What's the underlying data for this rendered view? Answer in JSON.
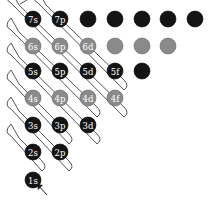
{
  "diagram": {
    "title": "",
    "type": "aufbau-principle-orbital-filling-order",
    "colors": {
      "dark": "#141414",
      "gray": "#8a8a8a",
      "label_text": "#ffffff",
      "line": "#555555",
      "background": "#ffffff"
    },
    "columns": {
      "s": 33,
      "p": 60,
      "d": 88,
      "f": 115,
      "g": 142,
      "h": 168,
      "i": 195
    },
    "rows": {
      "7": 19,
      "6": 46,
      "5": 71,
      "4": 98,
      "3": 125,
      "2": 152,
      "1": 180
    },
    "orbitals": [
      {
        "label": "7s",
        "row": "7",
        "col": "s",
        "tone": "dark"
      },
      {
        "label": "7p",
        "row": "7",
        "col": "p",
        "tone": "dark"
      },
      {
        "label": "",
        "row": "7",
        "col": "d",
        "tone": "dark"
      },
      {
        "label": "",
        "row": "7",
        "col": "f",
        "tone": "dark"
      },
      {
        "label": "",
        "row": "7",
        "col": "g",
        "tone": "dark"
      },
      {
        "label": "",
        "row": "7",
        "col": "h",
        "tone": "dark"
      },
      {
        "label": "",
        "row": "7",
        "col": "i",
        "tone": "dark"
      },
      {
        "label": "6s",
        "row": "6",
        "col": "s",
        "tone": "gray"
      },
      {
        "label": "6p",
        "row": "6",
        "col": "p",
        "tone": "gray"
      },
      {
        "label": "6d",
        "row": "6",
        "col": "d",
        "tone": "gray"
      },
      {
        "label": "",
        "row": "6",
        "col": "f",
        "tone": "gray"
      },
      {
        "label": "",
        "row": "6",
        "col": "g",
        "tone": "gray"
      },
      {
        "label": "",
        "row": "6",
        "col": "h",
        "tone": "gray"
      },
      {
        "label": "5s",
        "row": "5",
        "col": "s",
        "tone": "dark"
      },
      {
        "label": "5p",
        "row": "5",
        "col": "p",
        "tone": "dark"
      },
      {
        "label": "5d",
        "row": "5",
        "col": "d",
        "tone": "dark"
      },
      {
        "label": "5f",
        "row": "5",
        "col": "f",
        "tone": "dark"
      },
      {
        "label": "",
        "row": "5",
        "col": "g",
        "tone": "dark"
      },
      {
        "label": "4s",
        "row": "4",
        "col": "s",
        "tone": "gray"
      },
      {
        "label": "4p",
        "row": "4",
        "col": "p",
        "tone": "gray"
      },
      {
        "label": "4d",
        "row": "4",
        "col": "d",
        "tone": "gray"
      },
      {
        "label": "4f",
        "row": "4",
        "col": "f",
        "tone": "gray"
      },
      {
        "label": "3s",
        "row": "3",
        "col": "s",
        "tone": "dark"
      },
      {
        "label": "3p",
        "row": "3",
        "col": "p",
        "tone": "dark"
      },
      {
        "label": "3d",
        "row": "3",
        "col": "d",
        "tone": "dark"
      },
      {
        "label": "2s",
        "row": "2",
        "col": "s",
        "tone": "dark"
      },
      {
        "label": "2p",
        "row": "2",
        "col": "p",
        "tone": "dark"
      },
      {
        "label": "1s",
        "row": "1",
        "col": "s",
        "tone": "dark"
      }
    ],
    "filling_order": [
      "1s",
      "2s",
      "2p",
      "3s",
      "3p",
      "4s",
      "3d",
      "4p",
      "5s",
      "4d",
      "5p",
      "6s",
      "4f",
      "5d",
      "6p",
      "7s",
      "5f",
      "6d",
      "7p"
    ],
    "arrow": {
      "start": [
        47,
        195
      ],
      "end": [
        37,
        184
      ]
    }
  }
}
